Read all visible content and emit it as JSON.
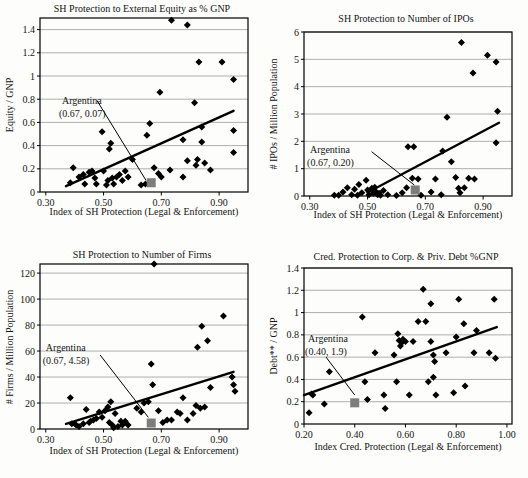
{
  "colors": {
    "background": "#fdfdfb",
    "point": "#000000",
    "trend": "#000000",
    "frame": "#000000",
    "grid": "#9b9b9b",
    "highlight": "#7d7d7d",
    "text": "#141414"
  },
  "chart_data": [
    {
      "type": "scatter",
      "title": "SH Protection to External Equity as % GNP",
      "xlabel": "Index of SH Protection (Legal & Enforcement)",
      "ylabel": "Equity / GNP",
      "xlim": [
        0.28,
        1.0
      ],
      "ylim": [
        0,
        1.5
      ],
      "grid": "horizontal",
      "legend": "none",
      "xticks": {
        "values": [
          0.3,
          0.5,
          0.7,
          0.9
        ],
        "labels": [
          "0.30",
          "0.50",
          "0.70",
          "0.90"
        ]
      },
      "yticks": {
        "values": [
          0,
          0.2,
          0.4,
          0.6,
          0.8,
          1.0,
          1.2,
          1.4
        ],
        "labels": [
          "0",
          "0.2",
          "0.4",
          "0.6",
          "0.8",
          "1",
          "1.2",
          "1.4"
        ]
      },
      "points": [
        [
          0.385,
          0.08
        ],
        [
          0.395,
          0.21
        ],
        [
          0.415,
          0.13
        ],
        [
          0.43,
          0.15
        ],
        [
          0.435,
          0.07
        ],
        [
          0.45,
          0.17
        ],
        [
          0.46,
          0.18
        ],
        [
          0.47,
          0.12
        ],
        [
          0.475,
          0.07
        ],
        [
          0.495,
          0.52
        ],
        [
          0.5,
          0.18
        ],
        [
          0.51,
          0.06
        ],
        [
          0.515,
          0.1
        ],
        [
          0.52,
          0.37
        ],
        [
          0.525,
          0.42
        ],
        [
          0.53,
          0.12
        ],
        [
          0.535,
          0.07
        ],
        [
          0.545,
          0.13
        ],
        [
          0.555,
          0.15
        ],
        [
          0.565,
          0.1
        ],
        [
          0.575,
          0.18
        ],
        [
          0.585,
          0.13
        ],
        [
          0.6,
          0.28
        ],
        [
          0.63,
          0.06
        ],
        [
          0.645,
          0.07
        ],
        [
          0.65,
          0.49
        ],
        [
          0.66,
          0.59
        ],
        [
          0.675,
          0.21
        ],
        [
          0.69,
          0.16
        ],
        [
          0.695,
          0.86
        ],
        [
          0.7,
          0.13
        ],
        [
          0.73,
          0.19
        ],
        [
          0.735,
          1.48
        ],
        [
          0.775,
          0.45
        ],
        [
          0.775,
          0.13
        ],
        [
          0.79,
          1.44
        ],
        [
          0.79,
          0.27
        ],
        [
          0.815,
          0.77
        ],
        [
          0.82,
          0.23
        ],
        [
          0.825,
          0.28
        ],
        [
          0.83,
          1.12
        ],
        [
          0.84,
          0.56
        ],
        [
          0.84,
          0.43
        ],
        [
          0.85,
          0.25
        ],
        [
          0.87,
          0.19
        ],
        [
          0.91,
          1.12
        ],
        [
          0.95,
          0.97
        ],
        [
          0.95,
          0.53
        ],
        [
          0.95,
          0.34
        ]
      ],
      "trend": [
        [
          0.37,
          0.05
        ],
        [
          0.95,
          0.7
        ]
      ],
      "highlight": {
        "label": "Argentina",
        "coords_label": "(0.67, 0.07)",
        "x": 0.665,
        "y": 0.08,
        "label_at": [
          0.356,
          0.76
        ],
        "leader": [
          [
            0.477,
            0.79
          ],
          [
            0.647,
            0.1
          ]
        ]
      }
    },
    {
      "type": "scatter",
      "title": "SH Protection to Number of IPOs",
      "xlabel": "Index of SH Protection (Legal & Enforcement)",
      "ylabel": "# IPOs / Million Population",
      "xlim": [
        0.28,
        1.0
      ],
      "ylim": [
        0,
        6
      ],
      "grid": "horizontal",
      "legend": "none",
      "xticks": {
        "values": [
          0.3,
          0.5,
          0.7,
          0.9
        ],
        "labels": [
          "0.30",
          "0.50",
          "0.70",
          "0.90"
        ]
      },
      "yticks": {
        "values": [
          0,
          1,
          2,
          3,
          4,
          5,
          6
        ],
        "labels": [
          "0",
          "1",
          "2",
          "3",
          "4",
          "5",
          "6"
        ]
      },
      "points": [
        [
          0.385,
          0.03
        ],
        [
          0.4,
          0.03
        ],
        [
          0.415,
          0.15
        ],
        [
          0.43,
          0.3
        ],
        [
          0.445,
          0.05
        ],
        [
          0.455,
          0.25
        ],
        [
          0.465,
          0.03
        ],
        [
          0.47,
          0.42
        ],
        [
          0.48,
          0.12
        ],
        [
          0.495,
          0.58
        ],
        [
          0.5,
          0.22
        ],
        [
          0.505,
          0.05
        ],
        [
          0.515,
          0.28
        ],
        [
          0.52,
          0.1
        ],
        [
          0.525,
          0.32
        ],
        [
          0.53,
          0.15
        ],
        [
          0.535,
          0.05
        ],
        [
          0.54,
          0.1
        ],
        [
          0.545,
          0.03
        ],
        [
          0.555,
          0.2
        ],
        [
          0.57,
          0.05
        ],
        [
          0.6,
          0.02
        ],
        [
          0.62,
          0.12
        ],
        [
          0.635,
          0.3
        ],
        [
          0.64,
          1.8
        ],
        [
          0.655,
          0.65
        ],
        [
          0.66,
          1.8
        ],
        [
          0.675,
          0.62
        ],
        [
          0.685,
          0.03
        ],
        [
          0.72,
          0.15
        ],
        [
          0.735,
          0.62
        ],
        [
          0.755,
          0.05
        ],
        [
          0.76,
          1.65
        ],
        [
          0.775,
          2.88
        ],
        [
          0.79,
          1.25
        ],
        [
          0.805,
          0.68
        ],
        [
          0.815,
          0.28
        ],
        [
          0.82,
          0.12
        ],
        [
          0.825,
          5.62
        ],
        [
          0.835,
          0.3
        ],
        [
          0.85,
          0.65
        ],
        [
          0.865,
          4.5
        ],
        [
          0.87,
          0.62
        ],
        [
          0.915,
          5.15
        ],
        [
          0.945,
          4.9
        ],
        [
          0.95,
          3.1
        ],
        [
          0.945,
          1.95
        ]
      ],
      "trend": [
        [
          0.5,
          0.13
        ],
        [
          0.955,
          2.68
        ]
      ],
      "highlight": {
        "label": "Argentina",
        "coords_label": "(0.67, 0.20)",
        "x": 0.665,
        "y": 0.22,
        "label_at": [
          0.301,
          1.57
        ],
        "leader": [
          [
            0.514,
            1.62
          ],
          [
            0.662,
            0.4
          ]
        ]
      }
    },
    {
      "type": "scatter",
      "title": "SH Protection to Number of Firms",
      "xlabel": "Index of SH Protection (Legal & Enforcement)",
      "ylabel": "# Firms / Million Population",
      "xlim": [
        0.28,
        1.0
      ],
      "ylim": [
        0,
        127
      ],
      "grid": "horizontal",
      "legend": "none",
      "xticks": {
        "values": [
          0.3,
          0.5,
          0.7,
          0.9
        ],
        "labels": [
          "0.30",
          "0.50",
          "0.70",
          "0.90"
        ]
      },
      "yticks": {
        "values": [
          0,
          20,
          40,
          60,
          80,
          100,
          120
        ],
        "labels": [
          "0",
          "20",
          "40",
          "60",
          "80",
          "100",
          "120"
        ]
      },
      "points": [
        [
          0.385,
          24
        ],
        [
          0.39,
          4
        ],
        [
          0.4,
          4
        ],
        [
          0.405,
          3
        ],
        [
          0.415,
          2
        ],
        [
          0.43,
          4
        ],
        [
          0.44,
          15
        ],
        [
          0.45,
          5
        ],
        [
          0.455,
          6
        ],
        [
          0.465,
          7
        ],
        [
          0.475,
          8
        ],
        [
          0.485,
          13
        ],
        [
          0.495,
          9
        ],
        [
          0.505,
          14
        ],
        [
          0.515,
          17
        ],
        [
          0.52,
          5
        ],
        [
          0.525,
          21
        ],
        [
          0.53,
          3
        ],
        [
          0.535,
          1
        ],
        [
          0.54,
          12
        ],
        [
          0.55,
          2
        ],
        [
          0.56,
          6
        ],
        [
          0.565,
          3
        ],
        [
          0.575,
          6
        ],
        [
          0.585,
          3
        ],
        [
          0.615,
          16
        ],
        [
          0.63,
          13
        ],
        [
          0.64,
          20
        ],
        [
          0.655,
          21
        ],
        [
          0.665,
          50
        ],
        [
          0.67,
          34
        ],
        [
          0.675,
          127
        ],
        [
          0.69,
          14
        ],
        [
          0.705,
          5
        ],
        [
          0.72,
          7
        ],
        [
          0.735,
          7
        ],
        [
          0.755,
          13
        ],
        [
          0.765,
          12
        ],
        [
          0.775,
          24
        ],
        [
          0.79,
          7
        ],
        [
          0.81,
          12
        ],
        [
          0.82,
          18
        ],
        [
          0.825,
          63
        ],
        [
          0.835,
          16
        ],
        [
          0.84,
          79
        ],
        [
          0.85,
          17
        ],
        [
          0.86,
          68
        ],
        [
          0.87,
          32
        ],
        [
          0.915,
          87
        ],
        [
          0.945,
          40
        ],
        [
          0.95,
          34
        ],
        [
          0.955,
          29
        ]
      ],
      "trend": [
        [
          0.37,
          4
        ],
        [
          0.95,
          44
        ]
      ],
      "highlight": {
        "label": "Argentina",
        "coords_label": "(0.67, 4.58)",
        "x": 0.665,
        "y": 4.6,
        "label_at": [
          0.3,
          60
        ],
        "leader": [
          [
            0.488,
            57
          ],
          [
            0.655,
            9
          ]
        ]
      }
    },
    {
      "type": "scatter",
      "title": "Cred. Protection to Corp. & Priv. Debt %GNP",
      "xlabel": "Index Cred. Protection (Legal & Enforcement)",
      "ylabel": "Debt** / GNP",
      "xlim": [
        0.2,
        1.02
      ],
      "ylim": [
        0,
        1.4
      ],
      "grid": "horizontal",
      "legend": "none",
      "xticks": {
        "values": [
          0.2,
          0.4,
          0.6,
          0.8,
          1.0
        ],
        "labels": [
          "0.20",
          "0.40",
          "0.60",
          "0.80",
          "1.00"
        ]
      },
      "yticks": {
        "values": [
          0,
          0.2,
          0.4,
          0.6,
          0.8,
          1.0,
          1.2,
          1.4
        ],
        "labels": [
          "0",
          "0.2",
          "0.4",
          "0.6",
          "0.8",
          "1",
          "1.2",
          "1.4"
        ]
      },
      "points": [
        [
          0.22,
          0.1
        ],
        [
          0.23,
          0.27
        ],
        [
          0.235,
          0.26
        ],
        [
          0.28,
          0.18
        ],
        [
          0.3,
          0.47
        ],
        [
          0.43,
          0.96
        ],
        [
          0.44,
          0.38
        ],
        [
          0.45,
          0.22
        ],
        [
          0.48,
          0.64
        ],
        [
          0.515,
          0.26
        ],
        [
          0.52,
          0.14
        ],
        [
          0.555,
          0.62
        ],
        [
          0.565,
          0.38
        ],
        [
          0.57,
          0.81
        ],
        [
          0.575,
          0.75
        ],
        [
          0.58,
          0.7
        ],
        [
          0.585,
          0.73
        ],
        [
          0.59,
          0.76
        ],
        [
          0.6,
          0.74
        ],
        [
          0.615,
          0.26
        ],
        [
          0.63,
          0.74
        ],
        [
          0.65,
          0.92
        ],
        [
          0.67,
          1.21
        ],
        [
          0.68,
          0.92
        ],
        [
          0.69,
          0.38
        ],
        [
          0.7,
          1.08
        ],
        [
          0.7,
          0.74
        ],
        [
          0.71,
          0.62
        ],
        [
          0.715,
          0.56
        ],
        [
          0.71,
          0.42
        ],
        [
          0.72,
          0.26
        ],
        [
          0.76,
          0.64
        ],
        [
          0.79,
          0.28
        ],
        [
          0.8,
          0.78
        ],
        [
          0.81,
          1.12
        ],
        [
          0.83,
          0.9
        ],
        [
          0.835,
          0.34
        ],
        [
          0.87,
          0.64
        ],
        [
          0.88,
          0.84
        ],
        [
          0.93,
          0.64
        ],
        [
          0.95,
          1.12
        ],
        [
          0.955,
          0.59
        ]
      ],
      "trend": [
        [
          0.2,
          0.26
        ],
        [
          0.96,
          0.87
        ]
      ],
      "highlight": {
        "label": "Argentina",
        "coords_label": "(0.40, 1.9)",
        "x": 0.4,
        "y": 0.19,
        "label_at": [
          0.216,
          0.74
        ],
        "leader": [
          [
            0.287,
            0.6
          ],
          [
            0.4,
            0.26
          ]
        ]
      }
    }
  ]
}
